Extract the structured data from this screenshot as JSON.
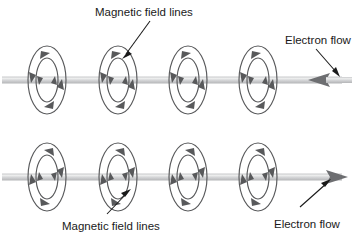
{
  "diagram": {
    "background_color": "#ffffff",
    "width": 361,
    "height": 242,
    "colors": {
      "field_line": "#58595b",
      "wire": "#b8b9bb",
      "wire_highlight": "#e8e9ea",
      "text": "#1a1a1a",
      "leader": "#1a1a1a",
      "flow_arrow": "#6d6e71"
    },
    "labels": {
      "top_field_lines": "Magnetic field lines",
      "top_electron_flow": "Electron flow",
      "bottom_field_lines": "Magnetic field lines",
      "bottom_electron_flow": "Electron flow"
    },
    "wires": [
      {
        "id": "top-wire",
        "y": 80,
        "x_start": 2,
        "x_end": 352,
        "flow_direction": "left",
        "arrow_position": "right-end",
        "field_circulation": "counterclockwise",
        "loop_count": 4,
        "loop_centers_x": [
          47,
          118,
          188,
          258
        ]
      },
      {
        "id": "bottom-wire",
        "y": 177,
        "x_start": 2,
        "x_end": 352,
        "flow_direction": "right",
        "arrow_position": "right-end",
        "field_circulation": "clockwise",
        "loop_count": 4,
        "loop_centers_x": [
          47,
          118,
          188,
          258
        ]
      }
    ],
    "loop_geometry": {
      "outer_rx": 19,
      "outer_ry": 34,
      "inner_rx": 11,
      "inner_ry": 22
    },
    "leaders": [
      {
        "id": "top-field-leader",
        "from_x": 148,
        "from_y": 22,
        "to_x": 123,
        "to_y": 56,
        "target": "top-loop-2"
      },
      {
        "id": "top-flow-leader",
        "from_x": 318,
        "from_y": 48,
        "to_x": 337,
        "to_y": 74,
        "target": "top-wire-arrow"
      },
      {
        "id": "bottom-field-leader",
        "from_x": 109,
        "from_y": 213,
        "to_x": 127,
        "to_y": 192,
        "target": "bottom-loop-2"
      },
      {
        "id": "bottom-flow-leader",
        "from_x": 302,
        "from_y": 206,
        "to_x": 328,
        "to_y": 182,
        "target": "bottom-wire-arrow"
      }
    ],
    "label_positions": {
      "top_field_lines": {
        "x": 95,
        "y": 16
      },
      "top_electron_flow": {
        "x": 285,
        "y": 44
      },
      "bottom_field_lines": {
        "x": 62,
        "y": 228
      },
      "bottom_electron_flow": {
        "x": 274,
        "y": 226
      }
    }
  }
}
